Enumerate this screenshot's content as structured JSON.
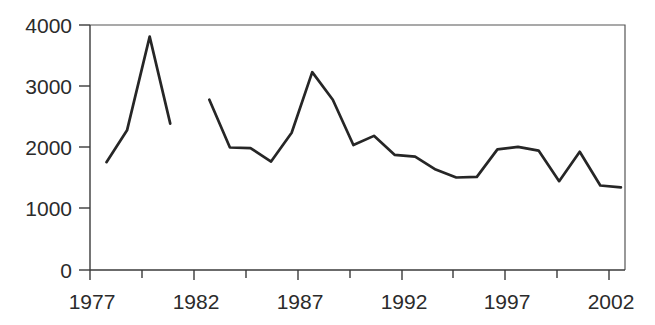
{
  "chart_data": {
    "type": "line",
    "title": "",
    "xlabel": "",
    "ylabel": "",
    "xlim": [
      1976.6,
      2002.6
    ],
    "ylim": [
      0,
      4000
    ],
    "grid": false,
    "legend": null,
    "y_ticks": [
      0,
      1000,
      2000,
      3000,
      4000
    ],
    "y_tick_labels": [
      "0",
      "1000",
      "2000",
      "3000",
      "4000"
    ],
    "x_ticks": [
      1977,
      1982,
      1987,
      1992,
      1997,
      2002
    ],
    "x_tick_labels": [
      "1977",
      "1982",
      "1987",
      "1992",
      "1997",
      "2002"
    ],
    "x_minor_ticks": [
      1979.5,
      1984.5,
      1989.5,
      1994.5,
      1999.5
    ],
    "line_color": "#262626",
    "series": [
      {
        "name": "segment-1",
        "x": [
          1977.4,
          1978.4,
          1979.5,
          1980.5
        ],
        "values": [
          1760,
          2280,
          3810,
          2390
        ]
      },
      {
        "name": "segment-2",
        "x": [
          1982.4,
          1983.4,
          1984.4,
          1985.4,
          1986.4,
          1987.4,
          1988.4,
          1989.4,
          1990.4,
          1991.4,
          1992.4,
          1993.4,
          1994.4,
          1995.4,
          1996.4,
          1997.4,
          1998.4,
          1999.4,
          2000.4,
          2001.4,
          2002.4
        ],
        "values": [
          2780,
          2000,
          1990,
          1770,
          2240,
          3230,
          2780,
          2040,
          2190,
          1880,
          1850,
          1640,
          1510,
          1520,
          1970,
          2010,
          1950,
          1450,
          1930,
          1380,
          1350
        ]
      }
    ],
    "series_combined_note": "two disjoint line segments, gap between 1981 and 1982"
  }
}
